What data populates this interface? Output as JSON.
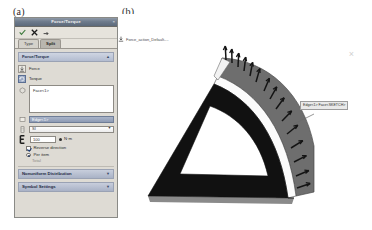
{
  "figure": {
    "label_a": "(a)",
    "label_b": "(b)"
  },
  "property_manager": {
    "title": "Force/Torque",
    "close_label": "×",
    "toolbar": {
      "ok_icon": "check-icon",
      "cancel_icon": "x-icon",
      "help_icon": "help-icon"
    },
    "tabs": [
      {
        "label": "Type",
        "selected": false
      },
      {
        "label": "Split",
        "selected": true
      }
    ],
    "groups": [
      {
        "title": "Force/Torque",
        "collapsed": false,
        "chevron": "▲"
      },
      {
        "title": "Nonuniform Distribution",
        "collapsed": true,
        "chevron": "▼"
      },
      {
        "title": "Symbol Settings",
        "collapsed": true,
        "chevron": "▼"
      }
    ],
    "load_types": [
      {
        "label": "Force",
        "icon": "force-arrow-icon",
        "selected": false
      },
      {
        "label": "Torque",
        "icon": "torque-icon",
        "selected": true
      }
    ],
    "face_selection": {
      "icon": "face-select-icon",
      "items": [
        "Face<1>"
      ]
    },
    "reference_field": {
      "icon": "reference-plane-icon",
      "value": "Edge<1>"
    },
    "unit_combo": {
      "icon": "units-icon",
      "value": "SI",
      "arrow": "▼"
    },
    "value_row": {
      "icon": "value-icon",
      "value": "100",
      "unit_label": "N·m",
      "unit_marker": "dot"
    },
    "options": [
      {
        "label": "Reverse direction",
        "control": "checkbox",
        "checked": true,
        "enabled": true
      },
      {
        "label": "Per item",
        "control": "radio",
        "checked": true,
        "enabled": true
      },
      {
        "label": "Total",
        "control": "radio",
        "checked": false,
        "enabled": false
      }
    ]
  },
  "cad_view": {
    "tree_item": {
      "icon": "force-tree-icon",
      "label": "Force_action_Default-..."
    },
    "view_marker": "×",
    "callout": {
      "label": "Edge<1> Face<SKETCH>"
    },
    "model": {
      "name": "triangular-bracket-arc",
      "description": "Triangular bracket with curved arc flange and distributed torque arrows",
      "body_color": "#121212",
      "flange_color": "#6f6f6f",
      "highlight_color": "#ffffff",
      "arrow_color": "#1a1a1a",
      "arrow_count": 18
    }
  }
}
